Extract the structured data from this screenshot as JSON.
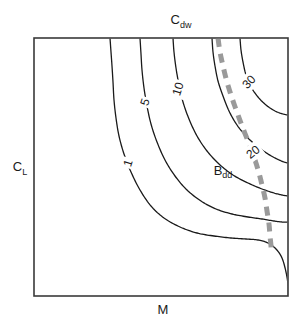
{
  "chart_data": {
    "type": "line",
    "title": "",
    "subtitle": "",
    "xlabel": "M",
    "ylabel": "C_L",
    "toplabel": "C_dw",
    "grid": false,
    "legend_position": "none",
    "axis_ticks": [],
    "xlim": [
      0,
      1
    ],
    "ylim": [
      0,
      1
    ],
    "contours": [
      {
        "label": "1",
        "value": 1,
        "color": "#1a1a1a",
        "style": "solid",
        "label_rotation": -72,
        "label_x": 128,
        "label_y": 163,
        "points": [
          [
            110,
            38
          ],
          [
            111,
            52
          ],
          [
            112,
            66
          ],
          [
            113,
            82
          ],
          [
            114,
            100
          ],
          [
            116,
            118
          ],
          [
            119,
            136
          ],
          [
            124,
            154
          ],
          [
            131,
            172
          ],
          [
            140,
            190
          ],
          [
            151,
            206
          ],
          [
            164,
            218
          ],
          [
            180,
            227
          ],
          [
            197,
            233
          ],
          [
            214,
            236
          ],
          [
            231,
            238
          ],
          [
            246,
            239
          ],
          [
            258,
            240
          ],
          [
            268,
            243
          ],
          [
            276,
            249
          ],
          [
            282,
            258
          ],
          [
            286,
            272
          ],
          [
            288,
            285
          ],
          [
            288,
            296
          ]
        ]
      },
      {
        "label": "5",
        "value": 5,
        "color": "#1a1a1a",
        "style": "solid",
        "label_rotation": -72,
        "label_x": 145,
        "label_y": 102,
        "points": [
          [
            140,
            38
          ],
          [
            141,
            54
          ],
          [
            142,
            70
          ],
          [
            144,
            88
          ],
          [
            147,
            106
          ],
          [
            151,
            124
          ],
          [
            157,
            142
          ],
          [
            165,
            160
          ],
          [
            175,
            176
          ],
          [
            187,
            190
          ],
          [
            201,
            201
          ],
          [
            216,
            209
          ],
          [
            232,
            214
          ],
          [
            248,
            217
          ],
          [
            262,
            219
          ],
          [
            274,
            221
          ],
          [
            282,
            222
          ],
          [
            288,
            222
          ]
        ]
      },
      {
        "label": "10",
        "value": 10,
        "color": "#1a1a1a",
        "style": "solid",
        "label_rotation": -72,
        "label_x": 178,
        "label_y": 89,
        "points": [
          [
            173,
            38
          ],
          [
            174,
            52
          ],
          [
            176,
            68
          ],
          [
            179,
            85
          ],
          [
            183,
            102
          ],
          [
            189,
            119
          ],
          [
            197,
            136
          ],
          [
            207,
            151
          ],
          [
            219,
            164
          ],
          [
            233,
            175
          ],
          [
            248,
            183
          ],
          [
            262,
            189
          ],
          [
            274,
            193
          ],
          [
            282,
            195
          ],
          [
            288,
            196
          ]
        ]
      },
      {
        "label": "20",
        "value": 20,
        "color": "#1a1a1a",
        "style": "solid",
        "label_rotation": -38,
        "label_x": 253,
        "label_y": 152,
        "points": [
          [
            212,
            38
          ],
          [
            213,
            52
          ],
          [
            215,
            66
          ],
          [
            218,
            81
          ],
          [
            223,
            96
          ],
          [
            229,
            111
          ],
          [
            237,
            125
          ],
          [
            247,
            137
          ],
          [
            258,
            147
          ],
          [
            268,
            154
          ],
          [
            277,
            159
          ],
          [
            284,
            162
          ],
          [
            288,
            163
          ]
        ]
      },
      {
        "label": "30",
        "value": 30,
        "color": "#1a1a1a",
        "style": "solid",
        "label_rotation": -46,
        "label_x": 249,
        "label_y": 82,
        "points": [
          [
            240,
            38
          ],
          [
            241,
            50
          ],
          [
            243,
            62
          ],
          [
            246,
            75
          ],
          [
            251,
            87
          ],
          [
            258,
            97
          ],
          [
            266,
            105
          ],
          [
            275,
            111
          ],
          [
            283,
            114
          ],
          [
            288,
            115
          ]
        ]
      }
    ],
    "dashed_boundary": {
      "label": "",
      "color": "#9a9a9a",
      "style": "dashed",
      "width": 5,
      "dash_pattern": "9 7",
      "points": [
        [
          218,
          38
        ],
        [
          220,
          52
        ],
        [
          223,
          66
        ],
        [
          227,
          82
        ],
        [
          232,
          98
        ],
        [
          238,
          115
        ],
        [
          244,
          131
        ],
        [
          250,
          146
        ],
        [
          255,
          160
        ],
        [
          259,
          173
        ],
        [
          262,
          185
        ],
        [
          265,
          198
        ],
        [
          267,
          211
        ],
        [
          269,
          224
        ],
        [
          270,
          236
        ],
        [
          271,
          246
        ],
        [
          271,
          252
        ]
      ]
    },
    "region_labels": [
      {
        "text": "B_dd",
        "base": "B",
        "sub": "dd",
        "x": 223,
        "y": 172
      }
    ],
    "frame": {
      "left": 34,
      "top": 38,
      "right": 288,
      "bottom": 296,
      "color": "#3a3a3a",
      "width": 1.6,
      "fill": "#ffffff"
    }
  },
  "labels": {
    "top_axis": "C",
    "top_axis_sub": "dw",
    "left_axis": "C",
    "left_axis_sub": "L",
    "bottom_axis": "M",
    "contour_1": "1",
    "contour_5": "5",
    "contour_10": "10",
    "contour_20": "20",
    "contour_30": "30",
    "region_bdd": "B",
    "region_bdd_sub": "dd"
  }
}
